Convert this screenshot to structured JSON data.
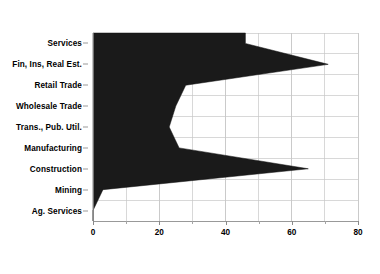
{
  "chart_data": {
    "type": "area",
    "orientation": "horizontal",
    "title": "",
    "subtitle": "",
    "xlabel": "",
    "ylabel": "",
    "categories": [
      "Services",
      "Fin, Ins, Real Est.",
      "Retail Trade",
      "Wholesale Trade",
      "Trans., Pub. Util.",
      "Manufacturing",
      "Construction",
      "Mining",
      "Ag. Services"
    ],
    "values": [
      46,
      71,
      28,
      25,
      23,
      26,
      65,
      3,
      0
    ],
    "xlim": [
      0,
      80
    ],
    "ylim_categories": 9,
    "xticks": [
      0,
      20,
      40,
      60,
      80
    ],
    "xtick_labels": [
      "0",
      "20",
      "40",
      "60",
      "80"
    ],
    "xticks_minor": [
      10,
      30,
      50,
      70
    ],
    "grid": true,
    "grid_axis": "x",
    "grid_interval": 10,
    "legend": false,
    "legend_position": "none",
    "fill_color": "#1a1a1a",
    "grid_color": "#c8c8c8",
    "axis_color": "#8a8a8a",
    "background": "#ffffff"
  }
}
